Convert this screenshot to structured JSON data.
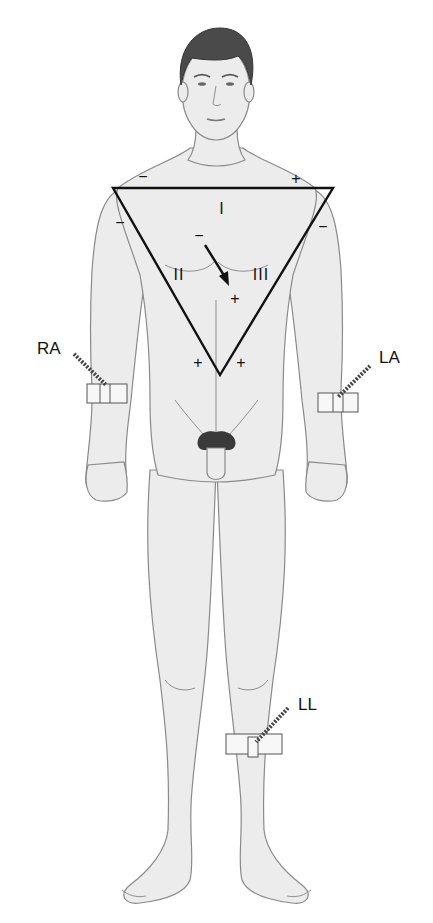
{
  "figure": {
    "triangle": {
      "lead_labels": [
        "I",
        "II",
        "III"
      ],
      "polarity": {
        "lead_I_left": "−",
        "lead_I_right": "+",
        "lead_II_top": "−",
        "lead_II_bottom": "+",
        "lead_III_top": "−",
        "lead_III_bottom": "+",
        "axis_start": "−",
        "axis_end": "+"
      }
    },
    "electrodes": [
      {
        "id": "RA",
        "label": "RA",
        "name": "right-arm"
      },
      {
        "id": "LA",
        "label": "LA",
        "name": "left-arm"
      },
      {
        "id": "LL",
        "label": "LL",
        "name": "left-leg"
      }
    ],
    "colors": {
      "triangle": "#111111",
      "skin": "#ececec",
      "outline": "#8a8a8a",
      "hair": "#4a4a4a"
    }
  }
}
